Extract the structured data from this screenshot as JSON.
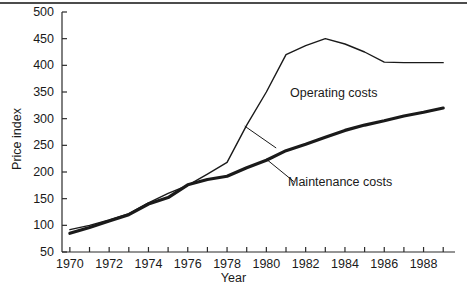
{
  "chart_data": {
    "type": "line",
    "title": "",
    "xlabel": "Year",
    "ylabel": "Price index",
    "xlim": [
      1969.6,
      1989.6
    ],
    "ylim": [
      50,
      500
    ],
    "grid": false,
    "legend_position": "inline-annotations",
    "y_ticks": [
      50,
      100,
      150,
      200,
      250,
      300,
      350,
      400,
      450,
      500
    ],
    "y_tick_labels": [
      "50",
      "100",
      "150",
      "200",
      "250",
      "300",
      "350",
      "400",
      "450",
      "500"
    ],
    "x_ticks": [
      1970,
      1971,
      1972,
      1973,
      1974,
      1975,
      1976,
      1977,
      1978,
      1979,
      1980,
      1981,
      1982,
      1983,
      1984,
      1985,
      1986,
      1987,
      1988,
      1989
    ],
    "x_tick_labels": [
      "1970",
      "",
      "1972",
      "",
      "1974",
      "",
      "1976",
      "",
      "1978",
      "",
      "1980",
      "",
      "1982",
      "",
      "1984",
      "",
      "1986",
      "",
      "1988",
      ""
    ],
    "x": [
      1970,
      1971,
      1972,
      1973,
      1974,
      1975,
      1976,
      1977,
      1978,
      1979,
      1980,
      1981,
      1982,
      1983,
      1984,
      1985,
      1986,
      1987,
      1988,
      1989
    ],
    "series": [
      {
        "name": "Operating costs",
        "color": "#1a1a1a",
        "line_width": 1.4,
        "values": [
          92,
          100,
          110,
          122,
          142,
          160,
          175,
          196,
          218,
          288,
          350,
          420,
          437,
          450,
          440,
          425,
          406,
          405,
          405,
          405
        ]
      },
      {
        "name": "Maintenance costs",
        "color": "#1a1a1a",
        "line_width": 3.2,
        "values": [
          85,
          96,
          108,
          120,
          140,
          152,
          176,
          186,
          192,
          208,
          222,
          240,
          252,
          265,
          278,
          288,
          296,
          305,
          312,
          320
        ]
      }
    ],
    "annotations": [
      {
        "text": "Operating costs",
        "series": "Operating costs",
        "leader_from_x": 1978.9,
        "leader_from_y": 286,
        "label_x": 1980.5,
        "label_y": 245
      },
      {
        "text": "Maintenance costs",
        "series": "Maintenance costs",
        "leader_from_x": 1980.0,
        "leader_from_y": 224,
        "label_x": 1981.4,
        "label_y": 182
      }
    ]
  }
}
